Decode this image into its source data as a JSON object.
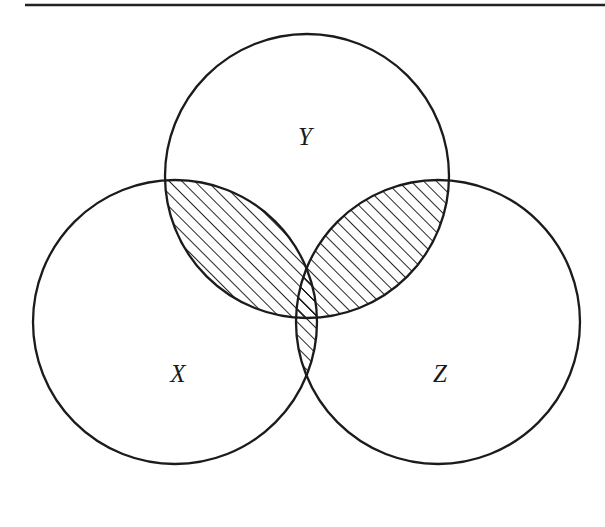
{
  "figure": {
    "kind": "venn-diagram",
    "caption_rule": {
      "present": true,
      "name": "horizontal-rule"
    },
    "canvas": {
      "width": 605,
      "height": 527,
      "background": "#ffffff"
    }
  },
  "colors": {
    "stroke": "#1b1b1b",
    "rule": "#232323",
    "hatch": "#1a1a1a",
    "background": "#ffffff",
    "label": "#1a1a1a"
  },
  "sets": [
    {
      "id": "X",
      "label": "X",
      "label_x": 178,
      "label_y": 382,
      "cx": 175,
      "cy": 322,
      "r": 142
    },
    {
      "id": "Y",
      "label": "Y",
      "label_x": 305,
      "label_y": 145,
      "cx": 307,
      "cy": 176,
      "r": 142
    },
    {
      "id": "Z",
      "label": "Z",
      "label_x": 440,
      "label_y": 382,
      "cx": 438,
      "cy": 322,
      "r": 142
    }
  ],
  "shading": {
    "style": "diagonal-hatch",
    "angle_degrees": 45,
    "direction": "lower-left-to-upper-right",
    "spacing_px": 9,
    "line_width_px": 1.9,
    "color": "#1a1a1a",
    "shaded_regions": [
      "X-and-Y",
      "Y-and-Z",
      "X-and-Z",
      "X-and-Y-and-Z"
    ],
    "unshaded_regions": [
      "X-only",
      "Y-only",
      "Z-only",
      "outside"
    ],
    "meaning": "elements belonging to at least two of the three sets"
  },
  "rule": {
    "x1": 25,
    "y1": 5,
    "x2": 605,
    "y2": 5
  },
  "label_font_size": 25
}
